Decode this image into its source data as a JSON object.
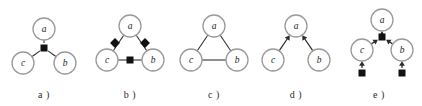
{
  "figure": {
    "width": 422,
    "height": 106,
    "background": "#ffffff",
    "node_stroke": "#9a9a9a",
    "node_fill": "#ffffff",
    "edge_color": "#2b2b2b",
    "square_color": "#111111",
    "caption_color": "#2b2b2b",
    "node_radius": 11,
    "square_size": 7
  },
  "panels": [
    {
      "id": "panel-a",
      "caption": "a )",
      "x": 0,
      "width": 88,
      "description": "factor-node star with three undirected edges",
      "nodes": [
        {
          "label": "a",
          "cx": 44,
          "cy": 29
        },
        {
          "label": "c",
          "cx": 23,
          "cy": 63
        },
        {
          "label": "b",
          "cx": 65,
          "cy": 63
        }
      ],
      "squares": [
        {
          "cx": 44,
          "cy": 48,
          "rotation": 0
        }
      ],
      "edges": [
        {
          "from": "square-0",
          "to": "a",
          "arrow": false
        },
        {
          "from": "square-0",
          "to": "c",
          "arrow": false
        },
        {
          "from": "square-0",
          "to": "b",
          "arrow": false
        }
      ]
    },
    {
      "id": "panel-b",
      "caption": "b )",
      "x": 88,
      "width": 84,
      "description": "triangle with factor squares on each edge",
      "nodes": [
        {
          "label": "a",
          "cx": 42,
          "cy": 26
        },
        {
          "label": "c",
          "cx": 19,
          "cy": 60
        },
        {
          "label": "b",
          "cx": 65,
          "cy": 60
        }
      ],
      "squares": [
        {
          "cx": 27,
          "cy": 43,
          "rotation": 45
        },
        {
          "cx": 57,
          "cy": 43,
          "rotation": 45
        },
        {
          "cx": 42,
          "cy": 60,
          "rotation": 0
        }
      ],
      "edges": [
        {
          "from": "a",
          "to": "c",
          "arrow": false
        },
        {
          "from": "a",
          "to": "b",
          "arrow": false
        },
        {
          "from": "c",
          "to": "b",
          "arrow": false
        }
      ]
    },
    {
      "id": "panel-c",
      "caption": "c )",
      "x": 172,
      "width": 84,
      "description": "plain undirected triangle",
      "nodes": [
        {
          "label": "a",
          "cx": 42,
          "cy": 26
        },
        {
          "label": "c",
          "cx": 19,
          "cy": 60
        },
        {
          "label": "b",
          "cx": 65,
          "cy": 60
        }
      ],
      "squares": [],
      "edges": [
        {
          "from": "a",
          "to": "c",
          "arrow": false
        },
        {
          "from": "a",
          "to": "b",
          "arrow": false
        },
        {
          "from": "c",
          "to": "b",
          "arrow": false
        }
      ]
    },
    {
      "id": "panel-d",
      "caption": "d )",
      "x": 256,
      "width": 80,
      "description": "v-structure with arrows into a",
      "nodes": [
        {
          "label": "a",
          "cx": 40,
          "cy": 26
        },
        {
          "label": "c",
          "cx": 17,
          "cy": 60
        },
        {
          "label": "b",
          "cx": 63,
          "cy": 60
        }
      ],
      "squares": [],
      "edges": [
        {
          "from": "c",
          "to": "a",
          "arrow": true
        },
        {
          "from": "b",
          "to": "a",
          "arrow": true
        }
      ]
    },
    {
      "id": "panel-e",
      "caption": "e )",
      "x": 336,
      "width": 86,
      "description": "directed factor graph with central and leaf squares",
      "nodes": [
        {
          "label": "a",
          "cx": 46,
          "cy": 20
        },
        {
          "label": "c",
          "cx": 26,
          "cy": 50
        },
        {
          "label": "b",
          "cx": 66,
          "cy": 50
        }
      ],
      "squares": [
        {
          "cx": 46,
          "cy": 37,
          "rotation": 0
        },
        {
          "cx": 26,
          "cy": 73,
          "rotation": 0
        },
        {
          "cx": 66,
          "cy": 73,
          "rotation": 0
        }
      ],
      "edges": [
        {
          "from": "square-0",
          "to": "a",
          "arrow": true
        },
        {
          "from": "c",
          "to": "square-0",
          "arrow": true
        },
        {
          "from": "b",
          "to": "square-0",
          "arrow": true
        },
        {
          "from": "square-1",
          "to": "c",
          "arrow": true
        },
        {
          "from": "square-2",
          "to": "b",
          "arrow": true
        }
      ]
    }
  ]
}
